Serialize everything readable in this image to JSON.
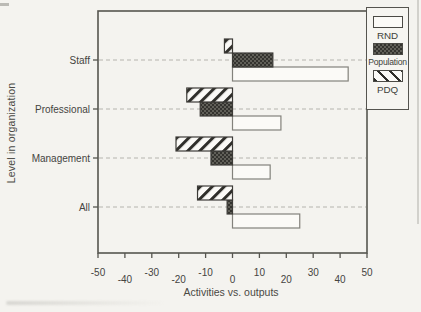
{
  "chart_data": {
    "type": "bar",
    "orientation": "horizontal",
    "title": "",
    "xlabel": "Activities vs. outputs",
    "ylabel": "Level in organization",
    "xlim": [
      -50,
      50
    ],
    "xticks": [
      -50,
      -40,
      -30,
      -20,
      -10,
      0,
      10,
      20,
      30,
      40,
      50
    ],
    "grid": "dashed horizontal line at each category",
    "legend_position": "top-right, outside plot frame",
    "categories": [
      "Staff",
      "Professional",
      "Management",
      "All"
    ],
    "series": [
      {
        "name": "RND",
        "pattern": "white-empty",
        "values": [
          43,
          18,
          14,
          25
        ]
      },
      {
        "name": "Population",
        "pattern": "dark-checker",
        "values": [
          15,
          -12,
          -8,
          -2
        ]
      },
      {
        "name": "PDQ",
        "pattern": "diagonal-hatch",
        "values": [
          -3,
          -17,
          -21,
          -13
        ]
      }
    ],
    "colors": {
      "paper": "#f4f3ef",
      "ink": "#45443f",
      "bar_fill_white": "#fbfaf7",
      "hatch_dark": "#2f2e2a",
      "gridline": "#b5b4ae",
      "frame": "#56554f"
    }
  }
}
